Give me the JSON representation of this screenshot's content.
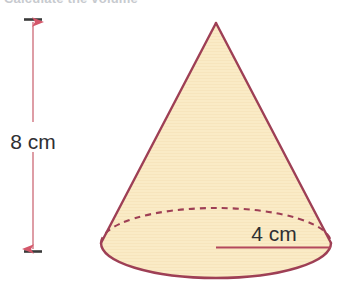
{
  "heading": {
    "text": "Calculate the volume",
    "note": "cropped at top edge"
  },
  "figure": {
    "name": "cone",
    "shape_label": "cone",
    "fill_color": "#FAEBC6",
    "outline_color": "#9E3F55",
    "dashed_color": "#9E3F55",
    "dimension_line_color": "#D98C96",
    "dimension_tick_color": "#3A3A3A",
    "radius_line_color": "#B3485C",
    "label_color": "#2f2f33",
    "background_color": "#ffffff"
  },
  "dimensions": {
    "height": {
      "value": "8",
      "unit": "cm",
      "label": "8 cm",
      "orientation": "vertical"
    },
    "radius": {
      "value": "4",
      "unit": "cm",
      "label": "4 cm",
      "orientation": "horizontal"
    }
  },
  "geometry": {
    "apex_x": 216,
    "apex_y": 23,
    "base_center_x": 216,
    "base_center_y": 243,
    "base_rx": 115,
    "base_ry": 35,
    "height_arrow_x": 32,
    "height_arrow_top_y": 23,
    "height_arrow_bottom_y": 248,
    "radius_line_y": 247,
    "radius_line_x1": 216,
    "radius_line_x2": 331
  }
}
